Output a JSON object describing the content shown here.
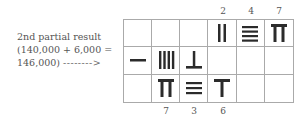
{
  "annotation": {
    "line1": "2nd partial result",
    "line2": "(140,000 + 6,000 =",
    "line3": "146,000)",
    "arrow": "-------->"
  },
  "top_labels": [
    "2",
    "4",
    "7"
  ],
  "bottom_labels": [
    "7",
    "3",
    "6"
  ],
  "grid": {
    "rows": 3,
    "cols": 6,
    "cells": [
      [
        "",
        "",
        "",
        "rod-2-vertical",
        "rod-4-horizontal",
        "rod-7-vertical"
      ],
      [
        "rod-1-horizontal",
        "rod-4-vertical",
        "rod-6-horizontal",
        "",
        "",
        ""
      ],
      [
        "",
        "rod-7-vertical",
        "rod-3-horizontal",
        "rod-6-vertical",
        "",
        ""
      ]
    ]
  },
  "colors": {
    "rod": "#2b2b2b",
    "grid_line": "#aaaaaa",
    "text": "#555555"
  }
}
